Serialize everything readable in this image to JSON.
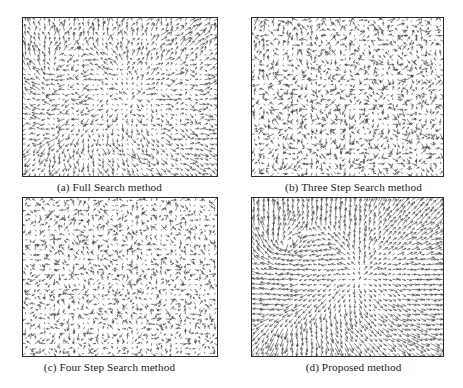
{
  "figure": {
    "type": "quiver-field-grid",
    "rows": 2,
    "columns": 2,
    "background_color": "#ffffff",
    "vector_color": "#3a3a3a",
    "frame_color": "#2b2b2b"
  },
  "panels": [
    {
      "id": "a",
      "label": "(a) Full Search method",
      "caption": "(a) Full Search method",
      "field_style": "coherent-with-noise",
      "coherence": 0.62,
      "noise": 0.38,
      "mean_vector_length": 5.2,
      "grid_cols": 40,
      "grid_rows": 32,
      "seed": 101
    },
    {
      "id": "b",
      "label": "(b) Three Step Search method",
      "caption": "(b) Three Step Search method",
      "field_style": "noisy",
      "coherence": 0.22,
      "noise": 0.78,
      "mean_vector_length": 4.4,
      "grid_cols": 40,
      "grid_rows": 32,
      "seed": 202
    },
    {
      "id": "c",
      "label": "(c) Four Step Search method",
      "caption": "(c) Four Step Search method",
      "field_style": "very-noisy-short",
      "coherence": 0.12,
      "noise": 0.88,
      "mean_vector_length": 3.4,
      "grid_cols": 40,
      "grid_rows": 32,
      "seed": 303
    },
    {
      "id": "d",
      "label": "(d) Proposed method",
      "caption": "(d) Proposed method",
      "field_style": "smooth-coherent",
      "coherence": 0.86,
      "noise": 0.14,
      "mean_vector_length": 5.8,
      "grid_cols": 40,
      "grid_rows": 32,
      "seed": 404
    }
  ]
}
